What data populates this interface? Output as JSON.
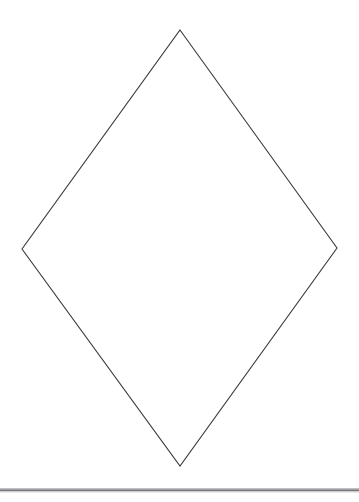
{
  "page": {
    "width": 359,
    "height": 502,
    "background_color": "#ffffff"
  },
  "figure": {
    "name": "rhombus-diamond-outline",
    "shape_type": "quadrilateral",
    "stroke_color": "#3a3a3c",
    "stroke_width": 1.1,
    "fill": "none",
    "vertices": [
      {
        "label": "top",
        "x": 180,
        "y": 30
      },
      {
        "label": "right",
        "x": 337,
        "y": 248
      },
      {
        "label": "bottom",
        "x": 180,
        "y": 466
      },
      {
        "label": "left",
        "x": 22,
        "y": 249
      }
    ],
    "points_attr": "180,30 337,248 180,466 22,249",
    "edges": [
      {
        "name": "top-right-edge",
        "from": "top",
        "to": "right"
      },
      {
        "name": "bottom-right-edge",
        "from": "right",
        "to": "bottom"
      },
      {
        "name": "bottom-left-edge",
        "from": "bottom",
        "to": "left"
      },
      {
        "name": "top-left-edge",
        "from": "left",
        "to": "top"
      }
    ],
    "horizontal_diagonal_px": 315,
    "vertical_diagonal_px": 436
  },
  "footer_rule": {
    "name": "horizontal-divider",
    "color": "#4a4a4e",
    "y": 490,
    "x_start": 0,
    "x_end": 359,
    "thickness": 1.2
  }
}
